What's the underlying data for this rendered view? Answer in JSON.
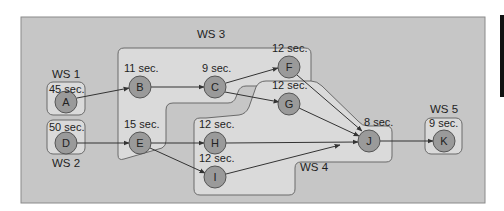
{
  "colors": {
    "background": "#c8c8c8",
    "panel_border": "#7a7a7a",
    "station_fill": "#dcdcdc",
    "station_stroke": "#6a6a6a",
    "node_fill": "#9a9a9a",
    "node_stroke": "#555555",
    "edge": "#333333",
    "side_bar": "#111111"
  },
  "workstations": [
    {
      "id": "ws1",
      "label": "WS 1",
      "members": [
        "A"
      ]
    },
    {
      "id": "ws2",
      "label": "WS 2",
      "members": [
        "D"
      ]
    },
    {
      "id": "ws3",
      "label": "WS 3",
      "members": [
        "B",
        "C",
        "E",
        "F"
      ]
    },
    {
      "id": "ws4",
      "label": "WS 4",
      "members": [
        "G",
        "H",
        "I",
        "J"
      ]
    },
    {
      "id": "ws5",
      "label": "WS 5",
      "members": [
        "K"
      ]
    }
  ],
  "nodes": [
    {
      "id": "A",
      "label": "A",
      "time": "45 sec."
    },
    {
      "id": "B",
      "label": "B",
      "time": "11 sec."
    },
    {
      "id": "C",
      "label": "C",
      "time": "9 sec."
    },
    {
      "id": "D",
      "label": "D",
      "time": "50 sec."
    },
    {
      "id": "E",
      "label": "E",
      "time": "15 sec."
    },
    {
      "id": "F",
      "label": "F",
      "time": "12 sec."
    },
    {
      "id": "G",
      "label": "G",
      "time": "12 sec."
    },
    {
      "id": "H",
      "label": "H",
      "time": "12 sec."
    },
    {
      "id": "I",
      "label": "I",
      "time": "12 sec."
    },
    {
      "id": "J",
      "label": "J",
      "time": "8 sec."
    },
    {
      "id": "K",
      "label": "K",
      "time": "9 sec."
    }
  ],
  "edges": [
    {
      "from": "A",
      "to": "B"
    },
    {
      "from": "B",
      "to": "C"
    },
    {
      "from": "C",
      "to": "F"
    },
    {
      "from": "C",
      "to": "G"
    },
    {
      "from": "D",
      "to": "E"
    },
    {
      "from": "E",
      "to": "H"
    },
    {
      "from": "E",
      "to": "I"
    },
    {
      "from": "F",
      "to": "J"
    },
    {
      "from": "G",
      "to": "J"
    },
    {
      "from": "H",
      "to": "J"
    },
    {
      "from": "I",
      "to": "J"
    },
    {
      "from": "J",
      "to": "K"
    }
  ]
}
